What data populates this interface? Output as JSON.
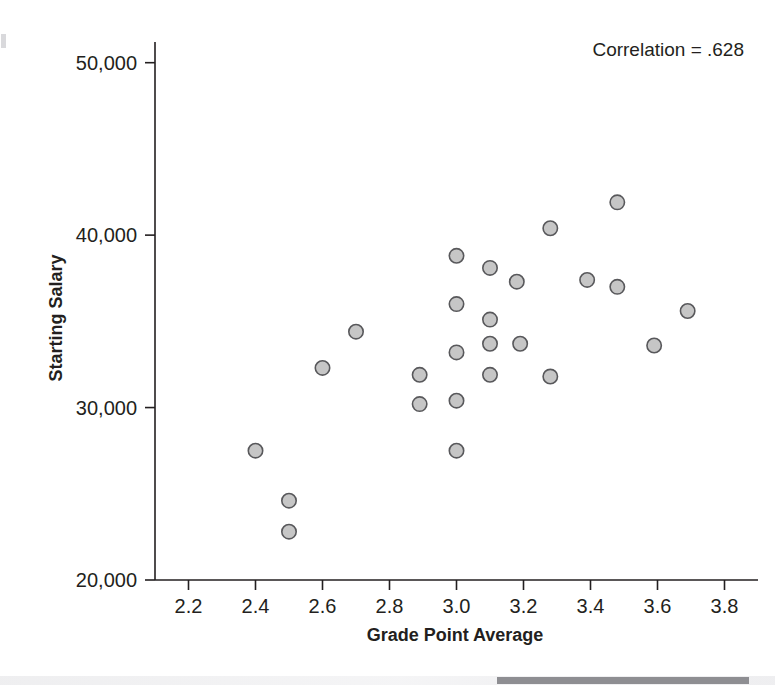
{
  "figure": {
    "title": "",
    "annotation": "Correlation = .628"
  },
  "axes": {
    "x_title": "Grade Point Average",
    "y_title": "Starting Salary",
    "x_ticks": [
      "2.2",
      "2.4",
      "2.6",
      "2.8",
      "3.0",
      "3.2",
      "3.4",
      "3.6",
      "3.8"
    ],
    "y_ticks": [
      "50,000",
      "40,000",
      "30,000",
      "20,000"
    ]
  },
  "colors": {
    "marker_fill": "#c6c6c6",
    "marker_stroke": "#58585b",
    "axis": "#231f20",
    "text": "#231f20",
    "background": "#ffffff",
    "scan_bar": "#8e8e92"
  },
  "chart_data": {
    "type": "scatter",
    "title": "",
    "xlabel": "Grade Point Average",
    "ylabel": "Starting Salary",
    "xlim": [
      2.1,
      3.9
    ],
    "ylim": [
      20000,
      51000
    ],
    "xticks": [
      2.2,
      2.4,
      2.6,
      2.8,
      3.0,
      3.2,
      3.4,
      3.6,
      3.8
    ],
    "yticks": [
      20000,
      30000,
      40000,
      50000
    ],
    "grid": false,
    "legend": false,
    "annotations": [
      {
        "text": "Correlation = .628",
        "x": 3.62,
        "y": 50200
      }
    ],
    "series": [
      {
        "name": "Graduates",
        "marker": "circle",
        "points": [
          {
            "x": 2.4,
            "y": 27500
          },
          {
            "x": 2.5,
            "y": 24600
          },
          {
            "x": 2.5,
            "y": 22800
          },
          {
            "x": 2.6,
            "y": 32300
          },
          {
            "x": 2.7,
            "y": 34400
          },
          {
            "x": 2.89,
            "y": 31900
          },
          {
            "x": 2.89,
            "y": 30200
          },
          {
            "x": 3.0,
            "y": 38800
          },
          {
            "x": 3.0,
            "y": 36000
          },
          {
            "x": 3.0,
            "y": 33200
          },
          {
            "x": 3.0,
            "y": 30400
          },
          {
            "x": 3.0,
            "y": 27500
          },
          {
            "x": 3.1,
            "y": 38100
          },
          {
            "x": 3.1,
            "y": 35100
          },
          {
            "x": 3.1,
            "y": 33700
          },
          {
            "x": 3.1,
            "y": 31900
          },
          {
            "x": 3.18,
            "y": 37300
          },
          {
            "x": 3.19,
            "y": 33700
          },
          {
            "x": 3.28,
            "y": 40400
          },
          {
            "x": 3.28,
            "y": 31800
          },
          {
            "x": 3.39,
            "y": 37400
          },
          {
            "x": 3.48,
            "y": 41900
          },
          {
            "x": 3.48,
            "y": 37000
          },
          {
            "x": 3.59,
            "y": 33600
          },
          {
            "x": 3.69,
            "y": 35600
          }
        ]
      }
    ]
  },
  "plot_geometry": {
    "left_px": 155,
    "right_px": 758,
    "top_px": 42,
    "bottom_px": 580,
    "x_data_min": 2.1,
    "x_data_max": 3.9,
    "y_data_min": 20000,
    "y_data_max": 51200,
    "marker_radius": 7.2
  }
}
